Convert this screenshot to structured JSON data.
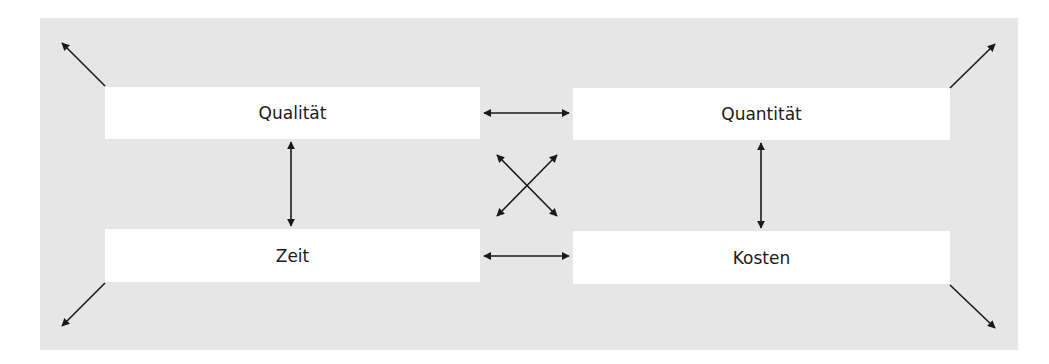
{
  "diagram": {
    "title": "",
    "nodes": [
      {
        "id": "qualitaet",
        "label": "Qualität"
      },
      {
        "id": "quantitaet",
        "label": "Quantität"
      },
      {
        "id": "zeit",
        "label": "Zeit"
      },
      {
        "id": "kosten",
        "label": "Kosten"
      }
    ],
    "edges": [
      {
        "from": "qualitaet",
        "to": "quantitaet",
        "type": "bidirectional"
      },
      {
        "from": "zeit",
        "to": "kosten",
        "type": "bidirectional"
      },
      {
        "from": "qualitaet",
        "to": "zeit",
        "type": "bidirectional"
      },
      {
        "from": "quantitaet",
        "to": "kosten",
        "type": "bidirectional"
      },
      {
        "from": "qualitaet",
        "to": "kosten",
        "type": "bidirectional"
      },
      {
        "from": "quantitaet",
        "to": "zeit",
        "type": "bidirectional"
      }
    ],
    "outward_arrows": [
      "qualitaet",
      "quantitaet",
      "zeit",
      "kosten"
    ],
    "colors": {
      "panel": "#e6e6e6",
      "box": "#ffffff",
      "arrow": "#1a1a1a"
    }
  }
}
